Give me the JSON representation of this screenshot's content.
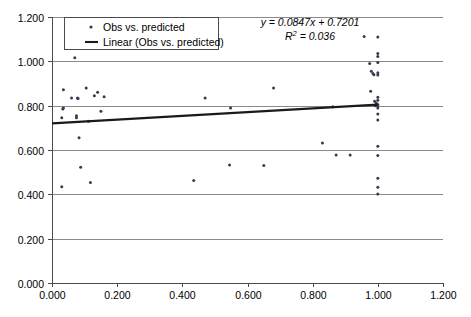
{
  "chart_data": {
    "type": "scatter",
    "title": "",
    "xlabel": "",
    "ylabel": "",
    "xlim": [
      0.0,
      1.2
    ],
    "ylim": [
      0.0,
      1.2
    ],
    "xticks": [
      "0.000",
      "0.200",
      "0.400",
      "0.600",
      "0.800",
      "1.000",
      "1.200"
    ],
    "yticks": [
      "0.000",
      "0.200",
      "0.400",
      "0.600",
      "0.800",
      "1.000",
      "1.200"
    ],
    "xtick_values": [
      0.0,
      0.2,
      0.4,
      0.6,
      0.8,
      1.0,
      1.2
    ],
    "ytick_values": [
      0.0,
      0.2,
      0.4,
      0.6,
      0.8,
      1.0,
      1.2
    ],
    "grid": "horizontal",
    "legend_position": "top-left-inside",
    "legend": [
      {
        "label": "Obs vs. predicted",
        "marker": "dot"
      },
      {
        "label": "Linear (Obs vs. predicted)",
        "marker": "line"
      }
    ],
    "annotations": {
      "equation": "y = 0.0847x + 0.7201",
      "equation_y": "y",
      "equation_rest": " = 0.0847x + 0.7201",
      "r_squared_label": "R",
      "r_squared_sup": "2",
      "r_squared_value": " = 0.036"
    },
    "trendline": {
      "name": "Linear (Obs vs. predicted)",
      "slope": 0.0847,
      "intercept": 0.7201,
      "r_squared": 0.036,
      "x_start": 0.0,
      "x_end": 1.0
    },
    "series": [
      {
        "name": "Obs vs. predicted",
        "points": [
          [
            0.03,
            0.434
          ],
          [
            0.03,
            0.745
          ],
          [
            0.033,
            0.785
          ],
          [
            0.035,
            0.79
          ],
          [
            0.035,
            0.872
          ],
          [
            0.06,
            0.835
          ],
          [
            0.07,
            1.016
          ],
          [
            0.075,
            0.755
          ],
          [
            0.075,
            0.745
          ],
          [
            0.078,
            0.835
          ],
          [
            0.08,
            0.832
          ],
          [
            0.083,
            0.655
          ],
          [
            0.088,
            0.522
          ],
          [
            0.105,
            0.88
          ],
          [
            0.112,
            0.73
          ],
          [
            0.118,
            0.453
          ],
          [
            0.13,
            0.845
          ],
          [
            0.14,
            0.86
          ],
          [
            0.15,
            0.775
          ],
          [
            0.16,
            0.84
          ],
          [
            0.435,
            0.462
          ],
          [
            0.47,
            0.835
          ],
          [
            0.545,
            0.532
          ],
          [
            0.548,
            0.79
          ],
          [
            0.65,
            0.53
          ],
          [
            0.68,
            0.88
          ],
          [
            0.83,
            0.632
          ],
          [
            0.862,
            0.795
          ],
          [
            0.872,
            0.577
          ],
          [
            0.915,
            0.577
          ],
          [
            0.958,
            1.112
          ],
          [
            0.975,
            0.99
          ],
          [
            0.978,
            0.865
          ],
          [
            0.98,
            0.955
          ],
          [
            0.985,
            0.945
          ],
          [
            0.988,
            0.94
          ],
          [
            0.99,
            0.82
          ],
          [
            0.992,
            0.8
          ],
          [
            0.995,
            0.812
          ],
          [
            1.0,
            1.11
          ],
          [
            1.0,
            1.035
          ],
          [
            1.0,
            1.022
          ],
          [
            1.0,
            0.995
          ],
          [
            1.0,
            0.948
          ],
          [
            1.0,
            0.938
          ],
          [
            1.0,
            0.838
          ],
          [
            1.0,
            0.825
          ],
          [
            1.0,
            0.805
          ],
          [
            1.0,
            0.798
          ],
          [
            1.0,
            0.79
          ],
          [
            1.0,
            0.762
          ],
          [
            1.0,
            0.735
          ],
          [
            1.0,
            0.617
          ],
          [
            1.0,
            0.575
          ],
          [
            1.0,
            0.472
          ],
          [
            1.0,
            0.432
          ],
          [
            1.0,
            0.402
          ]
        ]
      }
    ]
  },
  "colors": {
    "point": "#3a3a55",
    "trendline": "#1a1a1a",
    "gridline": "#8a8a8a",
    "axis": "#4a4a4a",
    "background": "#ffffff",
    "text": "#000000"
  }
}
